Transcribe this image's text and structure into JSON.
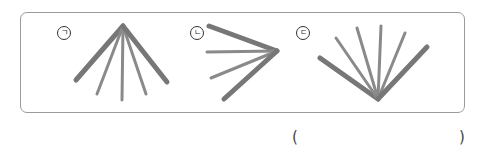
{
  "question": {
    "options": [
      {
        "label": "ㄱ",
        "description": "fan of 5 sticks joined at top, spreading downward"
      },
      {
        "label": "ㄴ",
        "description": "fan of 4 sticks joined at right, spreading leftward"
      },
      {
        "label": "ㄷ",
        "description": "fan of 6 sticks joined at bottom, spreading upward"
      }
    ],
    "answer_blank": {
      "open": "(",
      "close": ")",
      "value": ""
    }
  },
  "colors": {
    "stick": "#7a7a7a",
    "stick_light": "#8a8a8a",
    "border": "#9a9a9a"
  }
}
